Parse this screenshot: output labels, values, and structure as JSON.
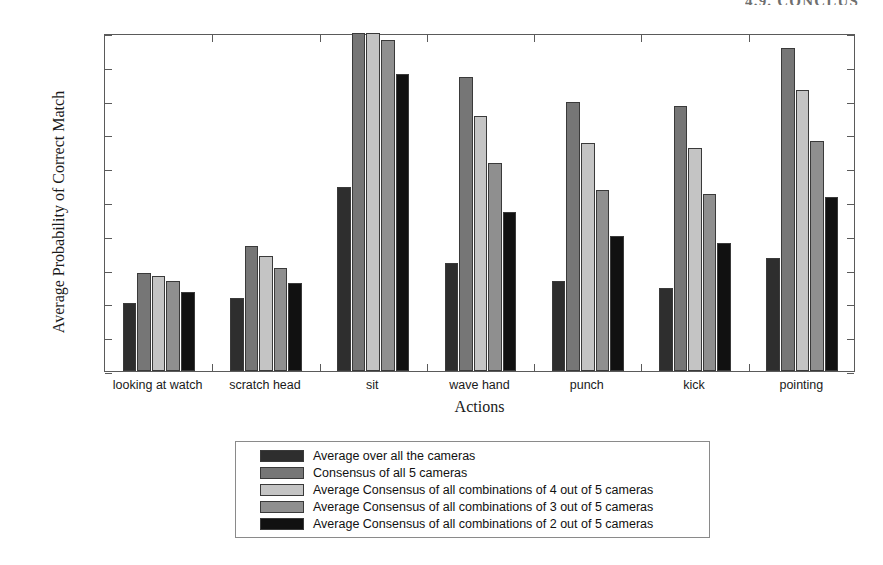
{
  "running_head": "4.9. CONCLUS",
  "chart_data": {
    "type": "bar",
    "title": "",
    "xlabel": "Actions",
    "ylabel": "Average Probability of Correct Match",
    "ylim": [
      0,
      1
    ],
    "yticks": [
      "0",
      "0.1",
      "0.2",
      "0.3",
      "0.4",
      "0.5",
      "0.6",
      "0.7",
      "0.8",
      "0.9",
      "1"
    ],
    "ytick_values": [
      0,
      0.1,
      0.2,
      0.3,
      0.4,
      0.5,
      0.6,
      0.7,
      0.8,
      0.9,
      1
    ],
    "grid": false,
    "legend_position": "below-axes",
    "categories": [
      "looking at watch",
      "scratch head",
      "sit",
      "wave hand",
      "punch",
      "kick",
      "pointing"
    ],
    "series": [
      {
        "name": "Average over all the cameras",
        "color": "#2e2e2e",
        "values": [
          0.2,
          0.215,
          0.545,
          0.32,
          0.265,
          0.245,
          0.335
        ]
      },
      {
        "name": "Consensus of all 5 cameras",
        "color": "#767676",
        "values": [
          0.29,
          0.37,
          1.0,
          0.87,
          0.795,
          0.785,
          0.955
        ]
      },
      {
        "name": "Average Consensus of all combinations of 4 out of 5 cameras",
        "color": "#c4c4c4",
        "values": [
          0.28,
          0.34,
          1.0,
          0.755,
          0.675,
          0.66,
          0.83
        ]
      },
      {
        "name": "Average Consensus of all combinations of 3 out of 5 cameras",
        "color": "#8f8f8f",
        "values": [
          0.265,
          0.305,
          0.98,
          0.615,
          0.535,
          0.525,
          0.68
        ]
      },
      {
        "name": "Average Consensus of all combinations of 2 out of 5 cameras",
        "color": "#111111",
        "values": [
          0.235,
          0.26,
          0.88,
          0.47,
          0.4,
          0.38,
          0.515
        ]
      }
    ]
  }
}
